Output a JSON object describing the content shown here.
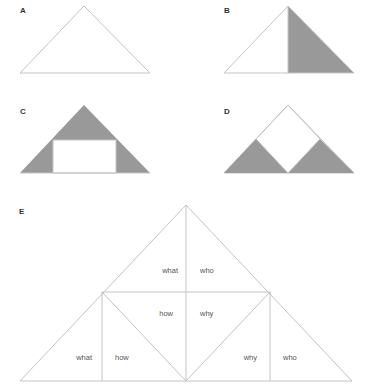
{
  "panels": {
    "a": {
      "label": "A"
    },
    "b": {
      "label": "B"
    },
    "c": {
      "label": "C"
    },
    "d": {
      "label": "D"
    },
    "e": {
      "label": "E",
      "words": {
        "top_left": "what",
        "top_right": "who",
        "mid_left": "how",
        "mid_right": "why",
        "bottom_left_outer": "what",
        "bottom_left_inner": "how",
        "bottom_right_inner": "why",
        "bottom_right_outer": "who"
      }
    }
  },
  "colors": {
    "line": "#c4c4c4",
    "shade": "#999999",
    "label": "#333333",
    "word": "#555555"
  }
}
